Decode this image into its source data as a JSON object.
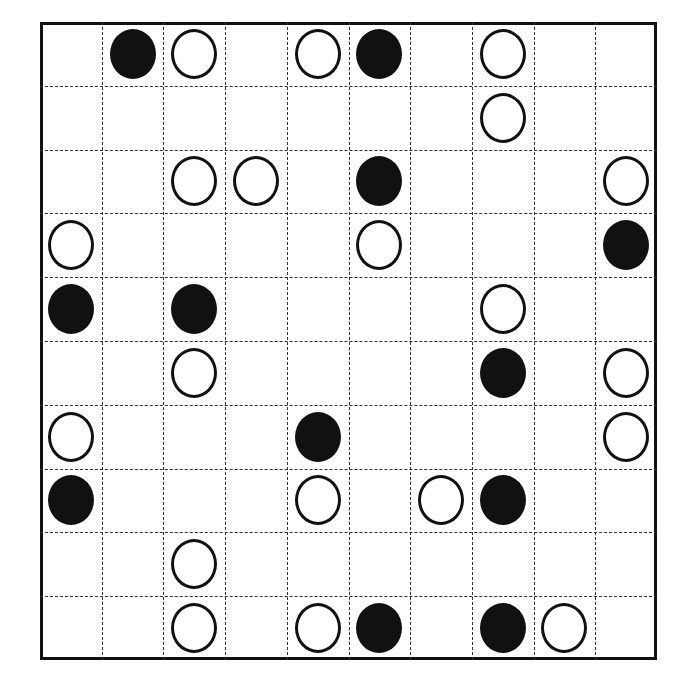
{
  "board": {
    "title": "go-board-diagram",
    "columns": 10,
    "rows": 10,
    "line_style": "dashed",
    "border_color": "#111111",
    "grid_color": "#333333",
    "background_color": "#ffffff",
    "black_stone_color": "#111111",
    "white_stone_color": "#ffffff",
    "legend": {
      "black": "black-stone",
      "white": "white-stone",
      "empty": "empty-intersection"
    },
    "cells": [
      [
        "empty",
        "black",
        "white",
        "empty",
        "white",
        "black",
        "empty",
        "white",
        "empty",
        "empty"
      ],
      [
        "empty",
        "empty",
        "empty",
        "empty",
        "empty",
        "empty",
        "empty",
        "white",
        "empty",
        "empty"
      ],
      [
        "empty",
        "empty",
        "white",
        "white",
        "empty",
        "black",
        "empty",
        "empty",
        "empty",
        "white"
      ],
      [
        "white",
        "empty",
        "empty",
        "empty",
        "empty",
        "white",
        "empty",
        "empty",
        "empty",
        "black"
      ],
      [
        "black",
        "empty",
        "black",
        "empty",
        "empty",
        "empty",
        "empty",
        "white",
        "empty",
        "empty"
      ],
      [
        "empty",
        "empty",
        "white",
        "empty",
        "empty",
        "empty",
        "empty",
        "black",
        "empty",
        "white"
      ],
      [
        "white",
        "empty",
        "empty",
        "empty",
        "black",
        "empty",
        "empty",
        "empty",
        "empty",
        "white"
      ],
      [
        "black",
        "empty",
        "empty",
        "empty",
        "white",
        "empty",
        "white",
        "black",
        "empty",
        "empty"
      ],
      [
        "empty",
        "empty",
        "white",
        "empty",
        "empty",
        "empty",
        "empty",
        "empty",
        "empty",
        "empty"
      ],
      [
        "empty",
        "empty",
        "white",
        "empty",
        "white",
        "black",
        "empty",
        "black",
        "white",
        "empty"
      ]
    ]
  },
  "chart_data": {
    "type": "heatmap",
    "title": "",
    "xlabel": "",
    "ylabel": "",
    "categories": [
      "c1",
      "c2",
      "c3",
      "c4",
      "c5",
      "c6",
      "c7",
      "c8",
      "c9",
      "c10"
    ],
    "rows": [
      "r1",
      "r2",
      "r3",
      "r4",
      "r5",
      "r6",
      "r7",
      "r8",
      "r9",
      "r10"
    ],
    "grid": true,
    "legend_position": "none",
    "values": [
      [
        0,
        1,
        2,
        0,
        2,
        1,
        0,
        2,
        0,
        0
      ],
      [
        0,
        0,
        0,
        0,
        0,
        0,
        0,
        2,
        0,
        0
      ],
      [
        0,
        0,
        2,
        2,
        0,
        1,
        0,
        0,
        0,
        2
      ],
      [
        2,
        0,
        0,
        0,
        0,
        2,
        0,
        0,
        0,
        1
      ],
      [
        1,
        0,
        1,
        0,
        0,
        0,
        0,
        2,
        0,
        0
      ],
      [
        0,
        0,
        2,
        0,
        0,
        0,
        0,
        1,
        0,
        2
      ],
      [
        2,
        0,
        0,
        0,
        1,
        0,
        0,
        0,
        0,
        2
      ],
      [
        1,
        0,
        0,
        0,
        2,
        0,
        2,
        1,
        0,
        0
      ],
      [
        0,
        0,
        2,
        0,
        0,
        0,
        0,
        0,
        0,
        0
      ],
      [
        0,
        0,
        2,
        0,
        2,
        1,
        0,
        1,
        2,
        0
      ]
    ],
    "value_legend": {
      "0": "empty",
      "1": "black",
      "2": "white"
    },
    "counts": {
      "black": 12,
      "white": 22,
      "empty": 66
    }
  }
}
